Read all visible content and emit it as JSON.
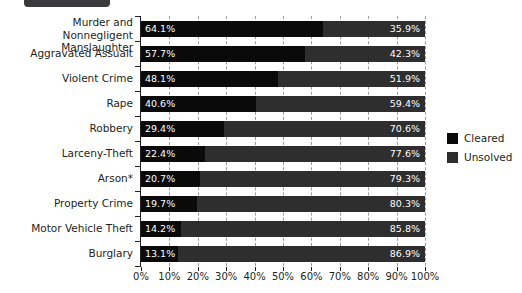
{
  "banner": {
    "name": "header-tab"
  },
  "legend": {
    "position": "right",
    "items": [
      {
        "label": "Cleared",
        "color": "#0a0a0a"
      },
      {
        "label": "Unsolved",
        "color": "#2e2e2e"
      }
    ]
  },
  "axis": {
    "x_ticks": [
      "0%",
      "10%",
      "20%",
      "30%",
      "40%",
      "50%",
      "60%",
      "70%",
      "80%",
      "90%",
      "100%"
    ]
  },
  "chart_data": {
    "type": "bar",
    "orientation": "horizontal",
    "stacked": true,
    "title": "",
    "subtitle": "",
    "xlabel": "",
    "ylabel": "",
    "xlim": [
      0,
      100
    ],
    "xtick_labels": [
      "0%",
      "10%",
      "20%",
      "30%",
      "40%",
      "50%",
      "60%",
      "70%",
      "80%",
      "90%",
      "100%"
    ],
    "xtick_values": [
      0,
      10,
      20,
      30,
      40,
      50,
      60,
      70,
      80,
      90,
      100
    ],
    "grid": "vertical-dashed",
    "legend_position": "right",
    "categories": [
      "Murder and Nonnegligent\nManslaughter",
      "Aggravated Assualt",
      "Violent Crime",
      "Rape",
      "Robbery",
      "Larceny-Theft",
      "Arson*",
      "Property Crime",
      "Motor Vehicle Theft",
      "Burglary"
    ],
    "series": [
      {
        "name": "Cleared",
        "color": "#0a0a0a",
        "values": [
          64.1,
          57.7,
          48.1,
          40.6,
          29.4,
          22.4,
          20.7,
          19.7,
          14.2,
          13.1
        ],
        "labels": [
          "64.1%",
          "57.7%",
          "48.1%",
          "40.6%",
          "29.4%",
          "22.4%",
          "20.7%",
          "19.7%",
          "14.2%",
          "13.1%"
        ]
      },
      {
        "name": "Unsolved",
        "color": "#2e2e2e",
        "values": [
          35.9,
          42.3,
          51.9,
          59.4,
          70.6,
          77.6,
          79.3,
          80.3,
          85.8,
          86.9
        ],
        "labels": [
          "35.9%",
          "42.3%",
          "51.9%",
          "59.4%",
          "70.6%",
          "77.6%",
          "79.3%",
          "80.3%",
          "85.8%",
          "86.9%"
        ]
      }
    ]
  }
}
